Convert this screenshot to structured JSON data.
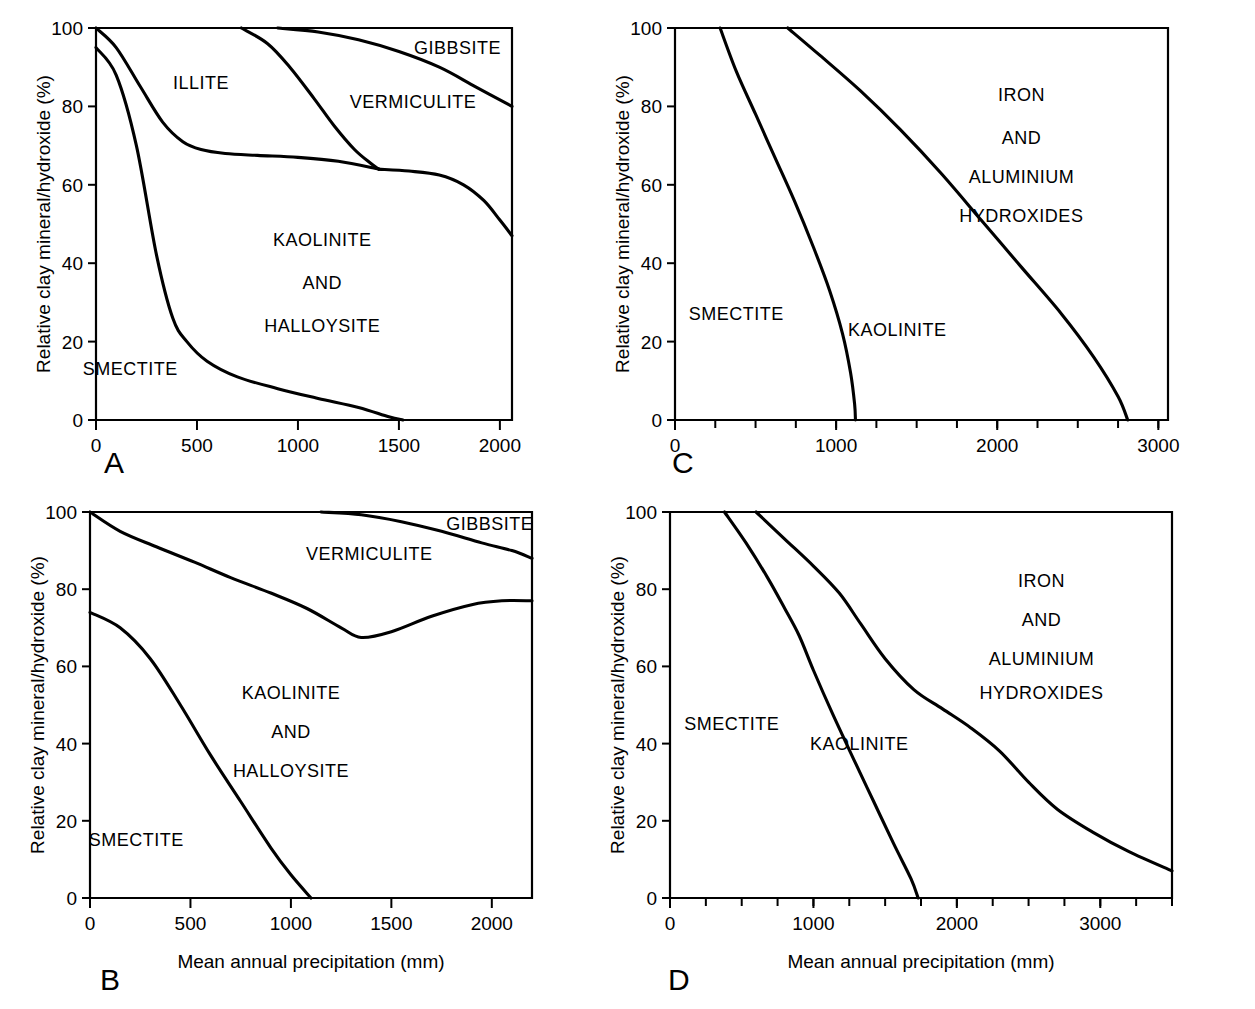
{
  "figure": {
    "background": "#ffffff",
    "line_color": "#000000",
    "panels": [
      "A",
      "B",
      "C",
      "D"
    ]
  },
  "chart_data": [
    {
      "id": "A",
      "type": "area",
      "panel_letter": "A",
      "title": "",
      "xlabel": "",
      "ylabel": "Relative clay mineral/hydroxide (%)",
      "xlim": [
        0,
        2060
      ],
      "ylim": [
        0,
        100
      ],
      "xticks": [
        0,
        500,
        1000,
        1500,
        2000
      ],
      "xticklabels": [
        "0",
        "500",
        "1000",
        "1500",
        "2000"
      ],
      "yticks": [
        0,
        20,
        40,
        60,
        80,
        100
      ],
      "yticklabels": [
        "0",
        "20",
        "40",
        "60",
        "80",
        "100"
      ],
      "grid": false,
      "legend": "none",
      "region_labels": [
        {
          "text": "SMECTITE",
          "x": 170,
          "y": 13
        },
        {
          "text": "ILLITE",
          "x": 520,
          "y": 86
        },
        {
          "text": "KAOLINITE",
          "x": 1120,
          "y": 46
        },
        {
          "text": "AND",
          "x": 1120,
          "y": 35
        },
        {
          "text": "HALLOYSITE",
          "x": 1120,
          "y": 24
        },
        {
          "text": "VERMICULITE",
          "x": 1570,
          "y": 81
        },
        {
          "text": "GIBBSITE",
          "x": 1790,
          "y": 95
        }
      ],
      "series": [
        {
          "name": "smectite-kaolinite boundary",
          "x": [
            0,
            100,
            200,
            300,
            380,
            450,
            550,
            700,
            900,
            1100,
            1300,
            1450,
            1520
          ],
          "values": [
            95,
            88,
            70,
            42,
            26,
            20,
            15,
            11,
            8,
            5.5,
            3.2,
            0.8,
            0
          ]
        },
        {
          "name": "illite-kaolinite boundary",
          "x": [
            0,
            100,
            220,
            330,
            430,
            520,
            640,
            800,
            1000,
            1200,
            1400
          ],
          "values": [
            100,
            95,
            85,
            76,
            71,
            69,
            68,
            67.5,
            67,
            66,
            64
          ]
        },
        {
          "name": "vermiculite lower boundary",
          "x": [
            720,
            850,
            960,
            1080,
            1180,
            1280,
            1360,
            1400
          ],
          "values": [
            100,
            96,
            90,
            82,
            75,
            69,
            65.5,
            64
          ]
        },
        {
          "name": "kaolinite upper boundary right branch",
          "x": [
            1400,
            1550,
            1700,
            1820,
            1920,
            2000,
            2060
          ],
          "values": [
            64,
            63.5,
            62.5,
            60,
            56,
            51,
            47
          ]
        },
        {
          "name": "gibbsite lower boundary",
          "x": [
            900,
            1100,
            1300,
            1500,
            1700,
            1880,
            2060
          ],
          "values": [
            100,
            99,
            97,
            94,
            90,
            85,
            80
          ]
        }
      ]
    },
    {
      "id": "B",
      "type": "area",
      "panel_letter": "B",
      "title": "",
      "xlabel": "Mean annual precipitation (mm)",
      "ylabel": "Relative clay mineral/hydroxide (%)",
      "xlim": [
        0,
        2200
      ],
      "ylim": [
        0,
        100
      ],
      "xticks": [
        0,
        500,
        1000,
        1500,
        2000
      ],
      "xticklabels": [
        "0",
        "500",
        "1000",
        "1500",
        "2000"
      ],
      "yticks": [
        0,
        20,
        40,
        60,
        80,
        100
      ],
      "yticklabels": [
        "0",
        "20",
        "40",
        "60",
        "80",
        "100"
      ],
      "grid": false,
      "legend": "none",
      "region_labels": [
        {
          "text": "SMECTITE",
          "x": 230,
          "y": 15
        },
        {
          "text": "KAOLINITE",
          "x": 1000,
          "y": 53
        },
        {
          "text": "AND",
          "x": 1000,
          "y": 43
        },
        {
          "text": "HALLOYSITE",
          "x": 1000,
          "y": 33
        },
        {
          "text": "VERMICULITE",
          "x": 1390,
          "y": 89
        },
        {
          "text": "GIBBSITE",
          "x": 1990,
          "y": 97
        }
      ],
      "series": [
        {
          "name": "smectite-kaolinite boundary",
          "x": [
            0,
            150,
            300,
            450,
            600,
            750,
            900,
            1000,
            1100
          ],
          "values": [
            74,
            70,
            62,
            50,
            37,
            25,
            13,
            6,
            0
          ]
        },
        {
          "name": "vermiculite lower boundary",
          "x": [
            0,
            150,
            330,
            520,
            700,
            900,
            1080,
            1250,
            1350,
            1500,
            1700,
            1900,
            2050,
            2200
          ],
          "values": [
            100,
            95,
            91,
            87,
            83,
            79,
            75,
            70,
            67.5,
            69,
            73,
            76,
            77,
            77
          ]
        },
        {
          "name": "gibbsite lower boundary",
          "x": [
            1150,
            1350,
            1550,
            1750,
            1950,
            2100,
            2200
          ],
          "values": [
            100,
            99.3,
            97.5,
            95,
            92,
            90,
            88
          ]
        }
      ]
    },
    {
      "id": "C",
      "type": "area",
      "panel_letter": "C",
      "title": "",
      "xlabel": "",
      "ylabel": "Relative clay mineral/hydroxide (%)",
      "xlim": [
        0,
        3060
      ],
      "ylim": [
        0,
        100
      ],
      "xticks": [
        0,
        1000,
        2000,
        3000
      ],
      "xticklabels": [
        "0",
        "1000",
        "2000",
        "3000"
      ],
      "minor_xtick_step": 250,
      "yticks": [
        0,
        20,
        40,
        60,
        80,
        100
      ],
      "yticklabels": [
        "0",
        "20",
        "40",
        "60",
        "80",
        "100"
      ],
      "grid": false,
      "legend": "none",
      "region_labels": [
        {
          "text": "SMECTITE",
          "x": 380,
          "y": 27
        },
        {
          "text": "KAOLINITE",
          "x": 1380,
          "y": 23
        },
        {
          "text": "IRON",
          "x": 2150,
          "y": 83
        },
        {
          "text": "AND",
          "x": 2150,
          "y": 72
        },
        {
          "text": "ALUMINIUM",
          "x": 2150,
          "y": 62
        },
        {
          "text": "HYDROXIDES",
          "x": 2150,
          "y": 52
        }
      ],
      "series": [
        {
          "name": "smectite-kaolinite boundary",
          "x": [
            280,
            380,
            500,
            620,
            740,
            860,
            960,
            1040,
            1090,
            1115,
            1120
          ],
          "values": [
            100,
            89,
            78,
            67,
            56,
            44,
            33,
            22,
            12,
            4,
            0
          ]
        },
        {
          "name": "kaolinite-hydroxides boundary",
          "x": [
            700,
            900,
            1150,
            1400,
            1650,
            1900,
            2150,
            2400,
            2600,
            2750,
            2810
          ],
          "values": [
            100,
            93,
            84,
            74,
            63,
            51,
            39,
            27,
            16,
            6,
            0
          ]
        }
      ]
    },
    {
      "id": "D",
      "type": "area",
      "panel_letter": "D",
      "title": "",
      "xlabel": "Mean annual precipitation (mm)",
      "ylabel": "Relative clay mineral/hydroxide (%)",
      "xlim": [
        0,
        3500
      ],
      "ylim": [
        0,
        100
      ],
      "xticks": [
        0,
        1000,
        2000,
        3000
      ],
      "xticklabels": [
        "0",
        "1000",
        "2000",
        "3000"
      ],
      "minor_xtick_step": 250,
      "yticks": [
        0,
        20,
        40,
        60,
        80,
        100
      ],
      "yticklabels": [
        "0",
        "20",
        "40",
        "60",
        "80",
        "100"
      ],
      "grid": false,
      "legend": "none",
      "region_labels": [
        {
          "text": "SMECTITE",
          "x": 430,
          "y": 45
        },
        {
          "text": "KAOLINITE",
          "x": 1320,
          "y": 40
        },
        {
          "text": "IRON",
          "x": 2590,
          "y": 82
        },
        {
          "text": "AND",
          "x": 2590,
          "y": 72
        },
        {
          "text": "ALUMINIUM",
          "x": 2590,
          "y": 62
        },
        {
          "text": "HYDROXIDES",
          "x": 2590,
          "y": 53
        }
      ],
      "series": [
        {
          "name": "smectite-kaolinite boundary",
          "x": [
            380,
            530,
            680,
            800,
            900,
            1000,
            1130,
            1280,
            1420,
            1560,
            1680,
            1730
          ],
          "values": [
            100,
            92,
            83,
            75,
            68,
            59,
            48,
            36,
            25,
            14,
            5,
            0
          ]
        },
        {
          "name": "kaolinite-hydroxides boundary",
          "x": [
            600,
            800,
            1000,
            1180,
            1330,
            1500,
            1700,
            1900,
            2100,
            2300,
            2500,
            2700,
            2950,
            3200,
            3500
          ],
          "values": [
            100,
            93,
            86,
            79,
            71,
            62,
            54,
            49,
            44,
            38,
            30,
            23,
            17,
            12,
            7
          ]
        }
      ]
    }
  ]
}
